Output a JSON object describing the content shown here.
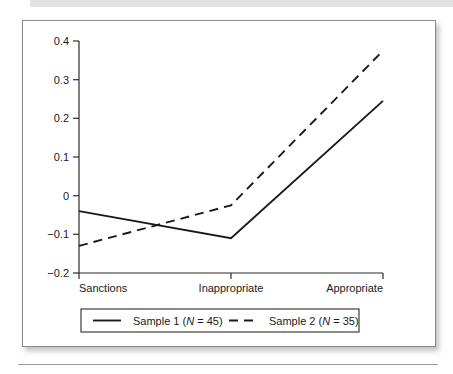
{
  "figure": {
    "background_color": "#ffffff",
    "frame_color": "#8a8a8a",
    "top_band_color": "#e2e2e2",
    "rule_color": "#9a9a9a"
  },
  "chart_data": {
    "type": "line",
    "title": "",
    "subtitle": "",
    "xlabel": "",
    "ylabel": "",
    "categories": [
      "Sanctions",
      "Inappropriate",
      "Appropriate"
    ],
    "series": [
      {
        "name": "Sample 1 (N = 45)",
        "style": "solid",
        "color": "#1a1a1a",
        "values": [
          -0.04,
          -0.11,
          0.245
        ]
      },
      {
        "name": "Sample 2 (N = 35)",
        "style": "dashed",
        "color": "#1a1a1a",
        "values": [
          -0.13,
          -0.025,
          0.375
        ]
      }
    ],
    "ylim": [
      -0.2,
      0.4
    ],
    "yticks": [
      "0.4",
      "0.3",
      "0.2",
      "0.1",
      "0",
      "−0.1",
      "−0.2"
    ],
    "ytick_values": [
      0.4,
      0.3,
      0.2,
      0.1,
      0,
      -0.1,
      -0.2
    ],
    "grid": false,
    "legend_position": "bottom"
  },
  "legend": {
    "entries": [
      {
        "label_prefix": "Sample 1 (",
        "label_italic": "N",
        "label_suffix": " = 45)",
        "style": "solid"
      },
      {
        "label_prefix": "Sample 2 (",
        "label_italic": "N",
        "label_suffix": " = 35)",
        "style": "dashed"
      }
    ]
  },
  "axis": {
    "ytick_0": "0.4",
    "ytick_1": "0.3",
    "ytick_2": "0.2",
    "ytick_3": "0.1",
    "ytick_4": "0",
    "ytick_5": "−0.1",
    "ytick_6": "−0.2",
    "cat_0": "Sanctions",
    "cat_1": "Inappropriate",
    "cat_2": "Appropriate"
  }
}
